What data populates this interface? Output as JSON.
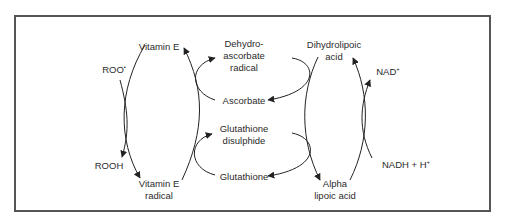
{
  "diagram": {
    "type": "antioxidant redox cycle network",
    "frame_color": "#555555",
    "line_color": "#222222",
    "text_color": "#2b2b2b",
    "nodes": {
      "roo": {
        "text": "ROO",
        "sup": "•"
      },
      "rooh": {
        "text": "ROOH"
      },
      "vitamin_e": {
        "line1": "Vitamin E"
      },
      "vitamin_e_radical": {
        "line1": "Vitamin E",
        "line2": "radical"
      },
      "dehydroascorbate": {
        "line1": "Dehydro-",
        "line2": "ascorbate",
        "line3": "radical"
      },
      "ascorbate": {
        "line1": "Ascorbate"
      },
      "glutathione_disulphide": {
        "line1": "Glutathione",
        "line2": "disulphide"
      },
      "glutathione": {
        "line1": "Glutathione"
      },
      "dihydrolipoic": {
        "line1": "Dihydrolipoic",
        "line2": "acid"
      },
      "alpha_lipoic": {
        "line1": "Alpha",
        "line2": "lipoic acid"
      },
      "nad": {
        "text": "NAD",
        "sup": "+"
      },
      "nadh": {
        "text": "NADH + H",
        "sup": "+"
      }
    },
    "edges": [
      {
        "from": "ROO•",
        "to": "ROOH"
      },
      {
        "from": "Vitamin E",
        "to": "Vitamin E radical"
      },
      {
        "from": "Vitamin E radical",
        "to": "Vitamin E"
      },
      {
        "from": "Ascorbate",
        "to": "Dehydro-ascorbate radical"
      },
      {
        "from": "Glutathione",
        "to": "Glutathione disulphide"
      },
      {
        "from": "Dehydro-ascorbate radical",
        "to": "Ascorbate"
      },
      {
        "from": "Glutathione disulphide",
        "to": "Glutathione"
      },
      {
        "from": "Dihydrolipoic acid",
        "to": "Alpha lipoic acid"
      },
      {
        "from": "Alpha lipoic acid",
        "to": "Dihydrolipoic acid"
      },
      {
        "from": "NADH + H+",
        "to": "NAD+"
      }
    ]
  }
}
